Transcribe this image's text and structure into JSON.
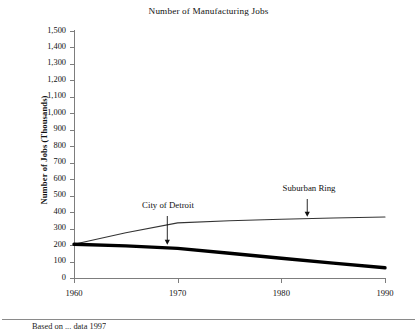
{
  "chart_data": {
    "type": "line",
    "title": "Number of Manufacturing Jobs",
    "xlabel": "",
    "ylabel": "Number of Jobs (Thousands)",
    "x": [
      1960,
      1970,
      1980,
      1990
    ],
    "xlim": [
      1960,
      1990
    ],
    "ylim": [
      0,
      1500
    ],
    "grid": false,
    "legend_position": "inline-annotations",
    "xticks": [
      "1960",
      "1970",
      "1980",
      "1990"
    ],
    "yticks": [
      "1,500",
      "1,400",
      "1,300",
      "1,200",
      "1,100",
      "1,000",
      "900",
      "800",
      "700",
      "600",
      "500",
      "400",
      "300",
      "200",
      "100",
      "0"
    ],
    "ytick_values": [
      1500,
      1400,
      1300,
      1200,
      1100,
      1000,
      900,
      800,
      700,
      600,
      500,
      400,
      300,
      200,
      100,
      0
    ],
    "series": [
      {
        "name": "City of Detroit",
        "style": "thick",
        "color": "#000000",
        "x": [
          1960,
          1965,
          1970,
          1975,
          1980,
          1985,
          1990
        ],
        "values": [
          205,
          195,
          180,
          150,
          120,
          90,
          62
        ]
      },
      {
        "name": "Suburban Ring",
        "style": "thin",
        "color": "#333333",
        "x": [
          1960,
          1965,
          1970,
          1975,
          1980,
          1985,
          1990
        ],
        "values": [
          205,
          275,
          335,
          348,
          357,
          364,
          370
        ]
      }
    ],
    "annotations": [
      {
        "text": "City of Detroit",
        "series": "City of Detroit",
        "arrow": "down",
        "at_x": 1969
      },
      {
        "text": "Suburban Ring",
        "series": "Suburban Ring",
        "arrow": "down",
        "at_x": 1982.5
      }
    ]
  },
  "footer": {
    "source_note": "Based on ... data 1997"
  },
  "colors": {
    "axis": "#7d7d7d",
    "text": "#111111",
    "detroit_line": "#000000",
    "suburb_line": "#333333",
    "rule": "#8a8a8a"
  }
}
